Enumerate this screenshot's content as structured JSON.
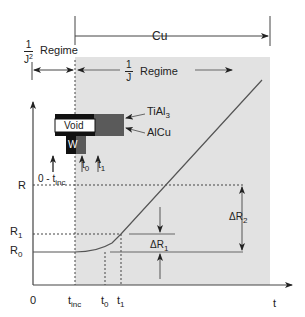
{
  "diagram": {
    "regimes": {
      "j2": {
        "prefix_num": "1",
        "prefix_den": "J",
        "den_sup": "2",
        "label": "Regime"
      },
      "j": {
        "prefix_num": "1",
        "prefix_den": "J",
        "label": "Regime"
      },
      "cu": {
        "label": "Cu"
      }
    },
    "stack": {
      "void_label": "Void",
      "w_label": "W",
      "tial3_label": "TiAl",
      "tial3_sub": "3",
      "alcu_label": "AlCu",
      "arrow_labels": {
        "t_range_main": "0 - t",
        "t_range_sub": "inc",
        "t0_main": "t",
        "t0_sub": "0",
        "t1_main": "t",
        "t1_sub": "1"
      }
    },
    "y_axis": {
      "ticks": [
        {
          "main": "R",
          "sub": ""
        },
        {
          "main": "R",
          "sub": "1"
        },
        {
          "main": "R",
          "sub": "0"
        }
      ]
    },
    "x_axis": {
      "label": "t",
      "ticks": [
        {
          "main": "0",
          "sub": ""
        },
        {
          "main": "t",
          "sub": "inc"
        },
        {
          "main": "t",
          "sub": "0"
        },
        {
          "main": "t",
          "sub": "1"
        }
      ]
    },
    "annotations": {
      "dr1_main": "ΔR",
      "dr1_sub": "1",
      "dr2_main": "ΔR",
      "dr2_sub": "2"
    },
    "colors": {
      "shade": "#e2e2e2",
      "line": "#555555",
      "void_fill": "#ffffff",
      "w_fill": "#111111",
      "alcu_fill": "#5a5a5a",
      "stack_border": "#111111"
    }
  }
}
